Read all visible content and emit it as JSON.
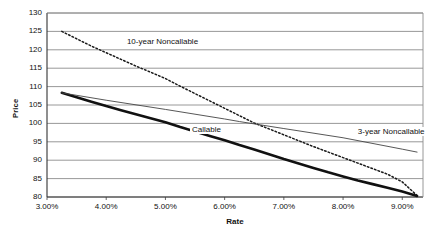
{
  "chart_data": {
    "type": "line",
    "title": "",
    "xlabel": "Rate",
    "ylabel": "Price",
    "xlim": [
      3.0,
      9.35
    ],
    "ylim": [
      80,
      130
    ],
    "grid": true,
    "legend_position": "inline-annotations",
    "x_tick_labels": [
      "3.00%",
      "4.00%",
      "5.00%",
      "6.00%",
      "7.00%",
      "8.00%",
      "9.00%"
    ],
    "x_tick_values": [
      3.0,
      4.0,
      5.0,
      6.0,
      7.0,
      8.0,
      9.0
    ],
    "y_tick_labels": [
      "80",
      "85",
      "90",
      "95",
      "100",
      "105",
      "110",
      "115",
      "120",
      "125",
      "130"
    ],
    "y_tick_values": [
      80,
      85,
      90,
      95,
      100,
      105,
      110,
      115,
      120,
      125,
      130
    ],
    "series": [
      {
        "name": "10-year Noncallable",
        "style": "dotted",
        "color": "#1a1a1a",
        "x": [
          3.25,
          3.5,
          3.75,
          4.0,
          4.25,
          4.5,
          4.75,
          5.0,
          5.25,
          5.5,
          5.75,
          6.0,
          6.25,
          6.5,
          6.75,
          7.0,
          7.25,
          7.5,
          7.75,
          8.0,
          8.25,
          8.5,
          8.75,
          9.0,
          9.25
        ],
        "y": [
          125.0,
          123.0,
          121.0,
          119.2,
          117.4,
          115.6,
          113.9,
          112.2,
          110.1,
          108.1,
          106.1,
          104.1,
          102.1,
          100.1,
          98.5,
          96.9,
          95.3,
          93.7,
          92.2,
          90.7,
          89.2,
          87.7,
          86.2,
          84.1,
          80.4
        ]
      },
      {
        "name": "Callable",
        "style": "solid-thick",
        "color": "#111111",
        "x": [
          3.25,
          3.5,
          3.75,
          4.0,
          4.25,
          4.5,
          4.75,
          5.0,
          5.25,
          5.5,
          5.75,
          6.0,
          6.25,
          6.5,
          6.75,
          7.0,
          7.25,
          7.5,
          7.75,
          8.0,
          8.25,
          8.5,
          8.75,
          9.0,
          9.25
        ],
        "y": [
          108.3,
          107.1,
          105.9,
          104.7,
          103.6,
          102.5,
          101.4,
          100.3,
          99.0,
          97.8,
          96.6,
          95.4,
          94.1,
          92.9,
          91.6,
          90.3,
          89.1,
          87.9,
          86.7,
          85.6,
          84.5,
          83.5,
          82.5,
          81.5,
          80.3
        ]
      },
      {
        "name": "3-year Noncallable",
        "style": "solid-thin",
        "color": "#444444",
        "x": [
          3.25,
          4.0,
          5.0,
          6.0,
          6.25,
          7.0,
          8.0,
          9.0,
          9.25
        ],
        "y": [
          108.3,
          106.3,
          103.8,
          101.2,
          100.5,
          98.6,
          96.1,
          93.0,
          92.2
        ]
      }
    ],
    "annotations": [
      {
        "text": "10-year Noncallable",
        "x": 4.35,
        "y": 122.0
      },
      {
        "text": "Callable",
        "x": 5.45,
        "y": 98.3
      },
      {
        "text": "3-year Noncallable",
        "x": 8.25,
        "y": 97.6
      }
    ]
  },
  "axis": {
    "x_title": "Rate",
    "y_title": "Price"
  },
  "colors": {
    "grid": "#8c8c8c",
    "axis": "#555555",
    "text": "#111111",
    "background": "#ffffff"
  }
}
